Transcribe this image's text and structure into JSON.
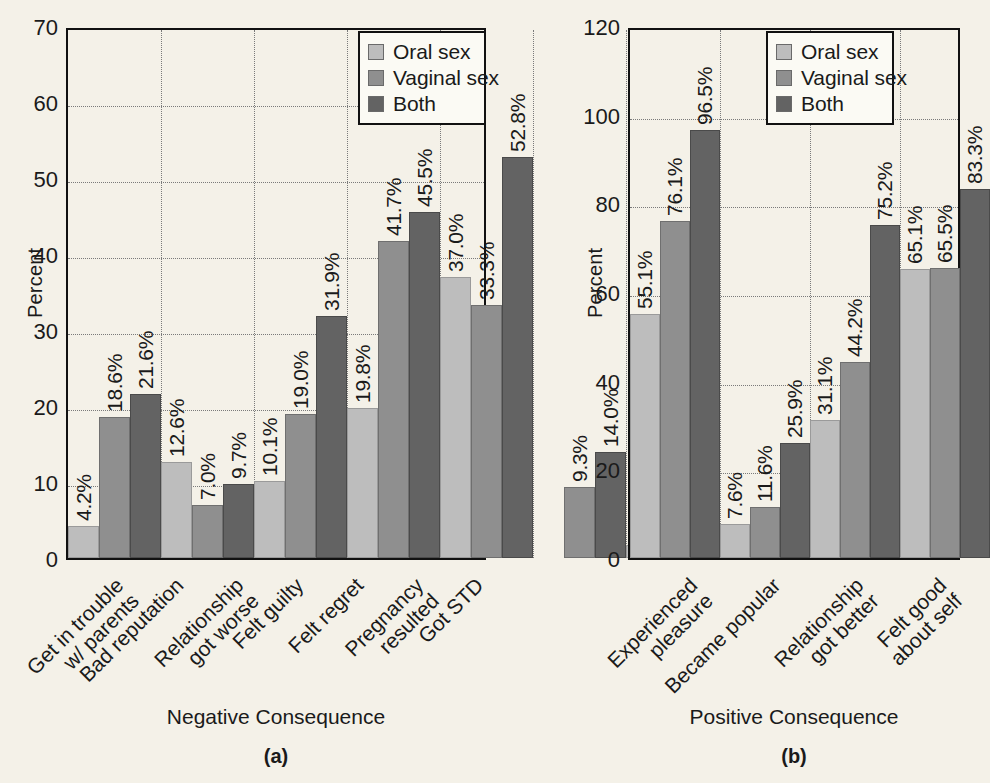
{
  "figure": {
    "background_color": "#f4f1e8",
    "series_colors": [
      "#bdbdbd",
      "#8f8f8f",
      "#636363"
    ],
    "series_names": [
      "Oral sex",
      "Vaginal sex",
      "Both"
    ]
  },
  "chart_data": [
    {
      "type": "bar",
      "panel": "(a)",
      "title": "",
      "xlabel": "Negative Consequence",
      "ylabel": "Percent",
      "ylim": [
        0,
        70
      ],
      "yticks": [
        0,
        10,
        20,
        30,
        40,
        50,
        60,
        70
      ],
      "grid": true,
      "legend_position": "top-right",
      "legend": [
        "Oral sex",
        "Vaginal sex",
        "Both"
      ],
      "categories": [
        "Get in trouble\nw/ parents",
        "Bad reputation",
        "Relationship\ngot worse",
        "Felt guilty",
        "Felt regret",
        "Pregnancy\nresulted",
        "Got STD"
      ],
      "categories_lines": [
        [
          "Get in trouble",
          "w/ parents"
        ],
        [
          "Bad reputation"
        ],
        [
          "Relationship",
          "got worse"
        ],
        [
          "Felt guilty"
        ],
        [
          "Felt regret"
        ],
        [
          "Pregnancy",
          "resulted"
        ],
        [
          "Got STD"
        ]
      ],
      "series": [
        {
          "name": "Oral sex",
          "values": [
            4.2,
            12.6,
            10.1,
            19.8,
            37.0,
            null,
            1.7
          ],
          "labels": [
            "4.2%",
            "12.6%",
            "10.1%",
            "19.8%",
            "37.0%",
            "",
            "1.7%"
          ]
        },
        {
          "name": "Vaginal sex",
          "values": [
            18.6,
            7.0,
            19.0,
            41.7,
            33.3,
            9.3,
            4.7
          ],
          "labels": [
            "18.6%",
            "7.0%",
            "19.0%",
            "41.7%",
            "33.3%",
            "9.3%",
            "4.7%"
          ]
        },
        {
          "name": "Both",
          "values": [
            21.6,
            9.7,
            31.9,
            45.5,
            52.8,
            14.0,
            13.0
          ],
          "labels": [
            "21.6%",
            "9.7%",
            "31.9%",
            "45.5%",
            "52.8%",
            "14.0%",
            "13.0%"
          ]
        }
      ]
    },
    {
      "type": "bar",
      "panel": "(b)",
      "title": "",
      "xlabel": "Positive Consequence",
      "ylabel": "Percent",
      "ylim": [
        0,
        120
      ],
      "yticks": [
        0,
        20,
        40,
        60,
        80,
        100,
        120
      ],
      "grid": true,
      "legend_position": "top-right",
      "legend": [
        "Oral sex",
        "Vaginal sex",
        "Both"
      ],
      "categories": [
        "Experienced\npleasure",
        "Became popular",
        "Relationship\ngot better",
        "Felt good\nabout self"
      ],
      "categories_lines": [
        [
          "Experienced",
          "pleasure"
        ],
        [
          "Became popular"
        ],
        [
          "Relationship",
          "got better"
        ],
        [
          "Felt good",
          "about self"
        ]
      ],
      "series": [
        {
          "name": "Oral sex",
          "values": [
            55.1,
            7.6,
            31.1,
            65.1
          ],
          "labels": [
            "55.1%",
            "7.6%",
            "31.1%",
            "65.1%"
          ]
        },
        {
          "name": "Vaginal sex",
          "values": [
            76.1,
            11.6,
            44.2,
            65.5
          ],
          "labels": [
            "76.1%",
            "11.6%",
            "44.2%",
            "65.5%"
          ]
        },
        {
          "name": "Both",
          "values": [
            96.5,
            25.9,
            75.2,
            83.3
          ],
          "labels": [
            "96.5%",
            "25.9%",
            "75.2%",
            "83.3%"
          ]
        }
      ]
    }
  ]
}
